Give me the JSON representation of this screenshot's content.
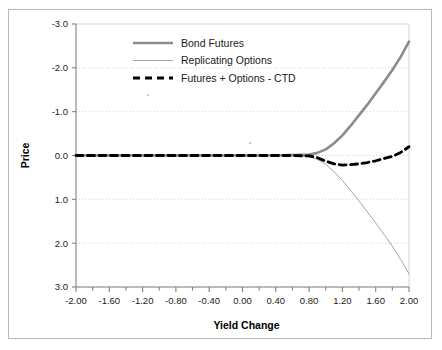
{
  "chart_data": {
    "type": "line",
    "title": "",
    "xlabel": "Yield Change",
    "ylabel": "Price",
    "xlim": [
      -2.0,
      2.0
    ],
    "ylim": [
      -3.0,
      3.0
    ],
    "y_axis_inverted": true,
    "grid": true,
    "legend_position": "top-center",
    "x_ticks": [
      "-2.00",
      "-1.60",
      "-1.20",
      "-0.80",
      "-0.40",
      "0.00",
      "0.40",
      "0.80",
      "1.20",
      "1.60",
      "2.00"
    ],
    "x_tick_values": [
      -2.0,
      -1.6,
      -1.2,
      -0.8,
      -0.4,
      0.0,
      0.4,
      0.8,
      1.2,
      1.6,
      2.0
    ],
    "x_minor_tick_interval": 0.2,
    "y_ticks": [
      "-3.0",
      "-2.0",
      "-1.0",
      "0.0",
      "1.0",
      "2.0",
      "3.0"
    ],
    "y_tick_values": [
      -3.0,
      -2.0,
      -1.0,
      0.0,
      1.0,
      2.0,
      3.0
    ],
    "x": [
      -2.0,
      -1.8,
      -1.6,
      -1.4,
      -1.2,
      -1.0,
      -0.8,
      -0.6,
      -0.4,
      -0.2,
      0.0,
      0.2,
      0.4,
      0.6,
      0.8,
      0.9,
      1.0,
      1.1,
      1.2,
      1.3,
      1.4,
      1.5,
      1.6,
      1.7,
      1.8,
      1.9,
      2.0
    ],
    "series": [
      {
        "name": "Bond Futures",
        "color": "#8c8c8c",
        "width": 2.6,
        "style": "solid",
        "values": [
          0.0,
          0.0,
          0.0,
          0.0,
          0.0,
          0.0,
          0.0,
          0.0,
          0.0,
          0.0,
          0.0,
          0.0,
          0.0,
          -0.01,
          -0.02,
          -0.06,
          -0.14,
          -0.28,
          -0.46,
          -0.68,
          -0.92,
          -1.16,
          -1.42,
          -1.68,
          -1.95,
          -2.25,
          -2.6
        ]
      },
      {
        "name": "Replicating Options",
        "color": "#9a9a9a",
        "width": 0.9,
        "style": "solid",
        "values": [
          0.0,
          0.0,
          0.0,
          0.0,
          0.0,
          0.0,
          0.0,
          0.0,
          0.0,
          0.0,
          0.0,
          0.0,
          0.0,
          0.01,
          0.03,
          0.09,
          0.2,
          0.37,
          0.57,
          0.8,
          1.04,
          1.29,
          1.54,
          1.8,
          2.07,
          2.37,
          2.7
        ]
      },
      {
        "name": "Futures + Options - CTD",
        "color": "#000000",
        "width": 2.8,
        "style": "dashed",
        "values": [
          0.0,
          0.0,
          0.0,
          0.0,
          0.0,
          0.0,
          0.0,
          0.0,
          0.0,
          0.0,
          0.0,
          0.0,
          0.0,
          0.0,
          0.01,
          0.05,
          0.13,
          0.19,
          0.22,
          0.21,
          0.19,
          0.16,
          0.12,
          0.07,
          0.02,
          -0.07,
          -0.2
        ]
      }
    ],
    "legend": [
      {
        "label": "Bond Futures",
        "swatch": "thick-gray-line"
      },
      {
        "label": "Replicating Options",
        "swatch": "thin-gray-line"
      },
      {
        "label": "Futures + Options - CTD",
        "swatch": "black-dashed-line"
      }
    ]
  },
  "colors": {
    "bond_futures": "#8c8c8c",
    "replicating_options": "#9a9a9a",
    "combined": "#000000",
    "grid": "#d2d2d2",
    "axis": "#808080",
    "frame": "#b8b8b8"
  }
}
